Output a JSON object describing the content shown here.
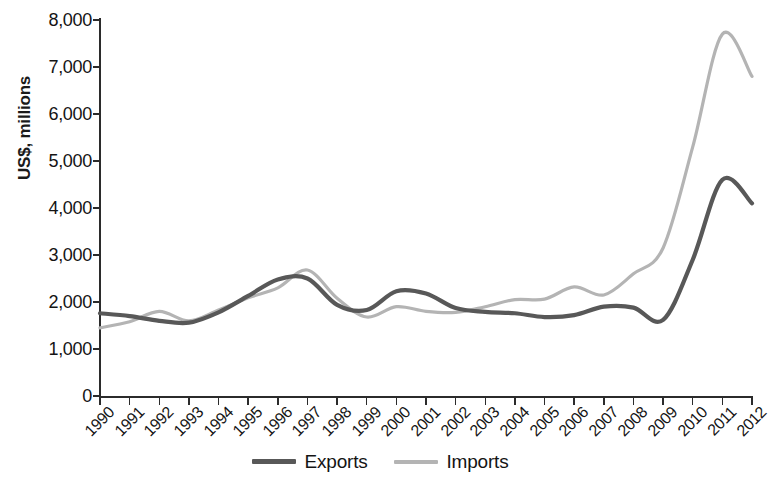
{
  "chart_data": {
    "type": "line",
    "title": "",
    "xlabel": "",
    "ylabel": "US$, millions",
    "ylim": [
      0,
      8000
    ],
    "ytick_step": 1000,
    "grid": false,
    "legend_position": "bottom",
    "categories": [
      "1990",
      "1991",
      "1992",
      "1993",
      "1994",
      "1995",
      "1996",
      "1997",
      "1998",
      "1999",
      "2000",
      "2001",
      "2002",
      "2003",
      "2004",
      "2005",
      "2006",
      "2007",
      "2008",
      "2009",
      "2010",
      "2011",
      "2012"
    ],
    "y_tick_labels": [
      "8,000",
      "7,000",
      "6,000",
      "5,000",
      "4,000",
      "3,000",
      "2,000",
      "1,000",
      "0"
    ],
    "series": [
      {
        "name": "Exports",
        "color": "#585858",
        "values": [
          1760,
          1700,
          1600,
          1560,
          1780,
          2130,
          2480,
          2500,
          1940,
          1830,
          2230,
          2180,
          1870,
          1790,
          1760,
          1680,
          1720,
          1900,
          1880,
          1620,
          2900,
          4600,
          4100
        ]
      },
      {
        "name": "Imports",
        "color": "#b4b4b4",
        "values": [
          1450,
          1580,
          1800,
          1600,
          1830,
          2090,
          2300,
          2680,
          2080,
          1680,
          1900,
          1800,
          1780,
          1900,
          2050,
          2060,
          2320,
          2150,
          2600,
          3150,
          5300,
          7700,
          6800
        ]
      }
    ]
  },
  "legend": {
    "items": [
      {
        "label": "Exports",
        "key": "exports"
      },
      {
        "label": "Imports",
        "key": "imports"
      }
    ]
  }
}
